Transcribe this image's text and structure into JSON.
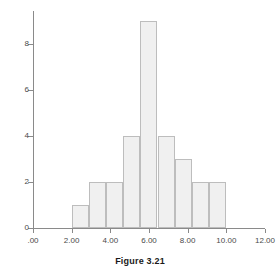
{
  "caption": "Figure 3.21",
  "chart_data": {
    "type": "bar",
    "title": "",
    "xlabel": "",
    "ylabel": "",
    "grid": false,
    "legend": false,
    "xlim": [
      0,
      12
    ],
    "ylim": [
      0,
      9.6
    ],
    "xticks": [
      0,
      2,
      4,
      6,
      8,
      10,
      12
    ],
    "xtick_labels": [
      ".00",
      "2.00",
      "4.00",
      "6.00",
      "8.00",
      "10.00",
      "12.00"
    ],
    "yticks": [
      0,
      2,
      4,
      6,
      8
    ],
    "ytick_labels": [
      "0",
      "2",
      "4",
      "6",
      "8"
    ],
    "bin_edges": [
      2.0,
      2.89,
      3.78,
      4.67,
      5.56,
      6.44,
      7.33,
      8.22,
      9.11,
      10.0
    ],
    "categories": [
      "2.00-2.89",
      "2.89-3.78",
      "3.78-4.67",
      "4.67-5.56",
      "5.56-6.44",
      "6.44-7.33",
      "7.33-8.22",
      "8.22-9.11",
      "9.11-10.00"
    ],
    "values": [
      1,
      2,
      2,
      4,
      9,
      4,
      3,
      2,
      2
    ],
    "bar_fill": "#f0f0f0",
    "bar_edge": "#bdbdbd",
    "axis_color": "#8a8a8a"
  }
}
